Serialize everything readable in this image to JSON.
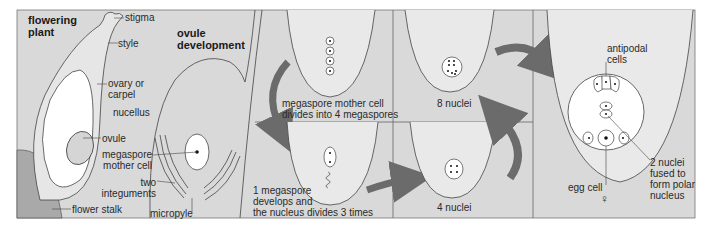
{
  "colors": {
    "panel_bg": "#d9d9d9",
    "cell_bg": "#e9e9e9",
    "white": "#ffffff",
    "stalk": "#a9a9a9",
    "arrow": "#6b6b6b",
    "line": "#444444"
  },
  "panels": {
    "flowering_plant": {
      "title": "flowering\nplant",
      "labels": {
        "stigma": "stigma",
        "style": "style",
        "ovary": "ovary or\ncarpel",
        "ovule": "ovule",
        "flower_stalk": "flower stalk"
      }
    },
    "ovule_development": {
      "title": "ovule\ndevelopment",
      "labels": {
        "nucellus": "nucellus",
        "megaspore_mother_cell": "megaspore\nmother cell",
        "two_integuments": "two\nintegu­ments",
        "micropyle": "micropyle"
      }
    },
    "step_4_megaspores": {
      "caption": "megaspore mother cell\ndivides into 4 megaspores"
    },
    "step_megaspore_develops": {
      "caption": "1 megaspore\ndevelops and\nthe nucleus divides 3 times"
    },
    "step_4_nuclei": {
      "caption": "4 nuclei"
    },
    "step_8_nuclei": {
      "caption": "8 nuclei"
    },
    "embryo_sac": {
      "labels": {
        "antipodal_cells": "antipodal\ncells",
        "polar_nucleus": "2 nuclei\nfused to\nform polar\nnucleus",
        "egg_cell": "egg cell",
        "female_symbol": "♀"
      }
    }
  }
}
